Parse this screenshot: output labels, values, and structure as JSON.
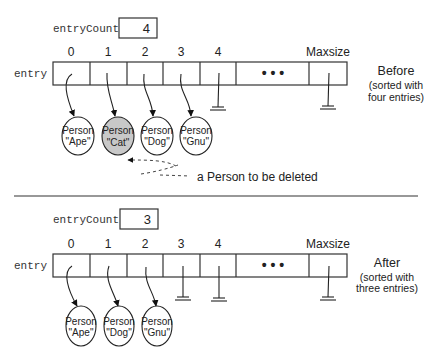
{
  "colors": {
    "line": "#222222",
    "deleted_fill": "#c8c8c8",
    "background": "#ffffff"
  },
  "before": {
    "count_label": "entryCount",
    "count_value": "4",
    "array_label": "entry",
    "indices": [
      "0",
      "1",
      "2",
      "3",
      "4"
    ],
    "ellipsis": "• • •",
    "max_label": "Maxsize",
    "persons": [
      {
        "type": "Person",
        "name": "\"Ape\"",
        "deleted": false
      },
      {
        "type": "Person",
        "name": "\"Cat\"",
        "deleted": true
      },
      {
        "type": "Person",
        "name": "\"Dog\"",
        "deleted": false
      },
      {
        "type": "Person",
        "name": "\"Gnu\"",
        "deleted": false
      }
    ],
    "annotation": "a Person to be deleted",
    "title": "Before",
    "subtitle_line1": "(sorted with",
    "subtitle_line2": "four entries)"
  },
  "after": {
    "count_label": "entryCount",
    "count_value": "3",
    "array_label": "entry",
    "indices": [
      "0",
      "1",
      "2",
      "3",
      "4"
    ],
    "ellipsis": "• • •",
    "max_label": "Maxsize",
    "persons": [
      {
        "type": "Person",
        "name": "\"Ape\""
      },
      {
        "type": "Person",
        "name": "\"Dog\""
      },
      {
        "type": "Person",
        "name": "\"Gnu\""
      }
    ],
    "title": "After",
    "subtitle_line1": "(sorted with",
    "subtitle_line2": "three entries)"
  }
}
